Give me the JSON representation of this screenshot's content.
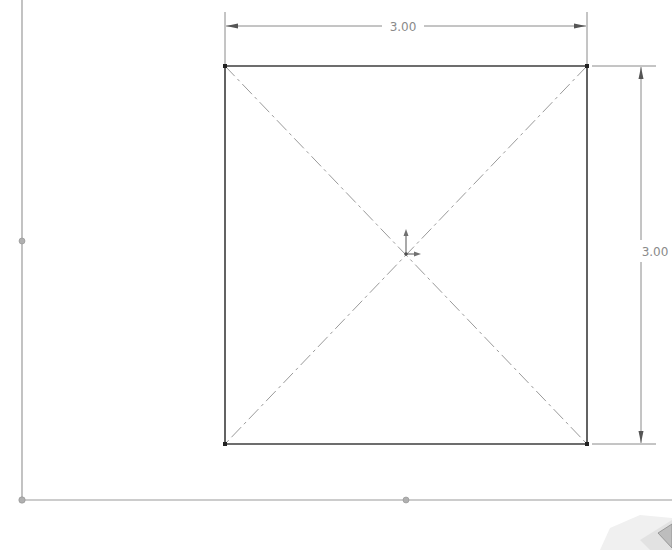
{
  "sketch": {
    "rectangle": {
      "x1": 225,
      "y1": 66,
      "x2": 587,
      "y2": 444,
      "stroke": "#3c3c3c"
    },
    "dimensions": [
      {
        "id": "width",
        "label": "3.00",
        "orientation": "horizontal"
      },
      {
        "id": "height",
        "label": "3.00",
        "orientation": "vertical"
      }
    ],
    "centerlines": 2,
    "origin_icon": "sketch-origin-arrows-icon",
    "reference_axes": {
      "vertical_x": 22,
      "horizontal_y": 500
    },
    "colors": {
      "geometry": "#3c3c3c",
      "dimension": "#8a8a8a",
      "centerline": "#9a9a9a",
      "origin": "#707070",
      "axis": "#9a9a9a"
    }
  },
  "view_triad": "view-orientation-triad-icon"
}
